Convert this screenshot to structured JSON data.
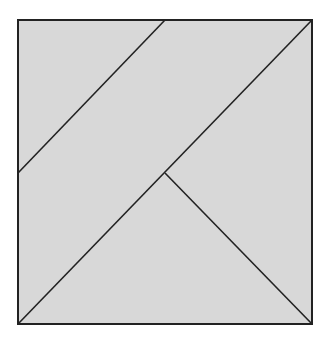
{
  "diagram": {
    "type": "tangram-square-dissection",
    "colors": {
      "fill": "#d8d8d8",
      "stroke": "#222222",
      "background": "#ffffff"
    },
    "square": {
      "x1": 18,
      "y1": 20,
      "x2": 312,
      "y2": 324
    },
    "segments": [
      {
        "name": "upper-left-diagonal",
        "from": [
          165,
          20
        ],
        "to": [
          18,
          173
        ]
      },
      {
        "name": "main-diagonal",
        "from": [
          312,
          20
        ],
        "to": [
          18,
          324
        ]
      },
      {
        "name": "lower-right-diagonal",
        "from": [
          165,
          173
        ],
        "to": [
          312,
          324
        ]
      }
    ],
    "regions": [
      {
        "name": "top-left-triangle"
      },
      {
        "name": "middle-band-parallelogram"
      },
      {
        "name": "right-triangle"
      },
      {
        "name": "bottom-triangle"
      }
    ]
  }
}
